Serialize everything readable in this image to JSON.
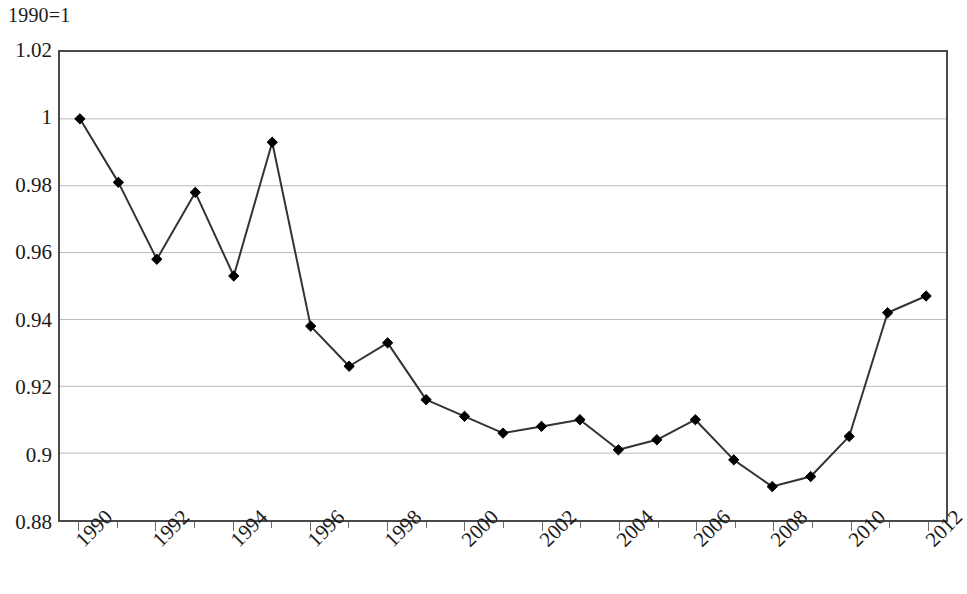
{
  "unit_note": "1990=1",
  "chart_data": {
    "type": "line",
    "title": "",
    "subtitle": "",
    "unit_note": "1990=1",
    "xlabel": "",
    "ylabel": "",
    "ylim": [
      0.88,
      1.02
    ],
    "xlim": [
      1990,
      2012
    ],
    "ytick_step": 0.02,
    "grid": true,
    "legend": false,
    "legend_position": "none",
    "marker": "diamond",
    "marker_color": "#000000",
    "line_color": "#333333",
    "ytick_labels": [
      "1.02",
      "1",
      "0.98",
      "0.96",
      "0.94",
      "0.92",
      "0.9",
      "0.88"
    ],
    "yticks": [
      1.02,
      1.0,
      0.98,
      0.96,
      0.94,
      0.92,
      0.9,
      0.88
    ],
    "xtick_labels": [
      "1990",
      "1992",
      "1994",
      "1996",
      "1998",
      "2000",
      "2002",
      "2004",
      "2006",
      "2008",
      "2010",
      "2012"
    ],
    "xticks": [
      1990,
      1992,
      1994,
      1996,
      1998,
      2000,
      2002,
      2004,
      2006,
      2008,
      2010,
      2012
    ],
    "categories": [
      1990,
      1991,
      1992,
      1993,
      1994,
      1995,
      1996,
      1997,
      1998,
      1999,
      2000,
      2001,
      2002,
      2003,
      2004,
      2005,
      2006,
      2007,
      2008,
      2009,
      2010,
      2011,
      2012
    ],
    "values": [
      1.0,
      0.981,
      0.958,
      0.978,
      0.953,
      0.993,
      0.938,
      0.926,
      0.933,
      0.916,
      0.911,
      0.906,
      0.908,
      0.91,
      0.901,
      0.904,
      0.91,
      0.898,
      0.89,
      0.893,
      0.905,
      0.942,
      0.947
    ],
    "series": [
      {
        "name": "index",
        "values": [
          1.0,
          0.981,
          0.958,
          0.978,
          0.953,
          0.993,
          0.938,
          0.926,
          0.933,
          0.916,
          0.911,
          0.906,
          0.908,
          0.91,
          0.901,
          0.904,
          0.91,
          0.898,
          0.89,
          0.893,
          0.905,
          0.942,
          0.947
        ]
      }
    ],
    "annotations": []
  }
}
